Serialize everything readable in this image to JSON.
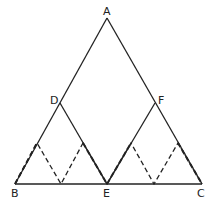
{
  "diagram": {
    "type": "geometry",
    "colors": {
      "stroke": "#222222",
      "background": "#ffffff"
    },
    "points": {
      "A": {
        "label": "A",
        "x": 107,
        "y": 18
      },
      "B": {
        "label": "B",
        "x": 15,
        "y": 184
      },
      "C": {
        "label": "C",
        "x": 202,
        "y": 184
      },
      "D": {
        "label": "D",
        "x": 60,
        "y": 103
      },
      "E": {
        "label": "E",
        "x": 107,
        "y": 184
      },
      "F": {
        "label": "F",
        "x": 155,
        "y": 103
      }
    },
    "solid_segments": [
      "AB",
      "AC",
      "BC",
      "DE",
      "EF"
    ],
    "dashed_zigzag": [
      {
        "x": 15,
        "y": 184
      },
      {
        "x": 37,
        "y": 143
      },
      {
        "x": 61,
        "y": 184
      },
      {
        "x": 83,
        "y": 143
      },
      {
        "x": 107,
        "y": 184
      },
      {
        "x": 131,
        "y": 143
      },
      {
        "x": 154,
        "y": 184
      },
      {
        "x": 178,
        "y": 143
      },
      {
        "x": 202,
        "y": 184
      }
    ],
    "labels": {
      "A": "A",
      "B": "B",
      "C": "C",
      "D": "D",
      "E": "E",
      "F": "F"
    }
  }
}
